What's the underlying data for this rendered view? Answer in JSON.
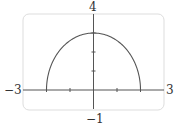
{
  "chart_data": {
    "type": "line",
    "title": "",
    "xlabel": "",
    "ylabel": "",
    "xlim": [
      -3,
      3
    ],
    "ylim": [
      -1,
      4
    ],
    "x_tick_marks": [
      -2,
      -1,
      1,
      2
    ],
    "y_tick_marks": [
      1,
      2,
      3
    ],
    "edge_labels": {
      "x_min": "−3",
      "x_max": "3",
      "y_min": "−1",
      "y_max": "4"
    },
    "grid": false,
    "series": [
      {
        "name": "upper half-ellipse",
        "description": "y = 3*sqrt(1 - x^2/4), -2 <= x <= 2",
        "x": [
          -2,
          -1.75,
          -1.5,
          -1.25,
          -1,
          -0.75,
          -0.5,
          -0.25,
          0,
          0.25,
          0.5,
          0.75,
          1,
          1.25,
          1.5,
          1.75,
          2
        ],
        "y": [
          0,
          1.45,
          1.98,
          2.34,
          2.6,
          2.78,
          2.9,
          2.98,
          3,
          2.98,
          2.9,
          2.78,
          2.6,
          2.34,
          1.98,
          1.45,
          0
        ]
      }
    ],
    "colors": {
      "curve": "#555555",
      "axes": "#555555",
      "frame": "#dddddd"
    }
  }
}
